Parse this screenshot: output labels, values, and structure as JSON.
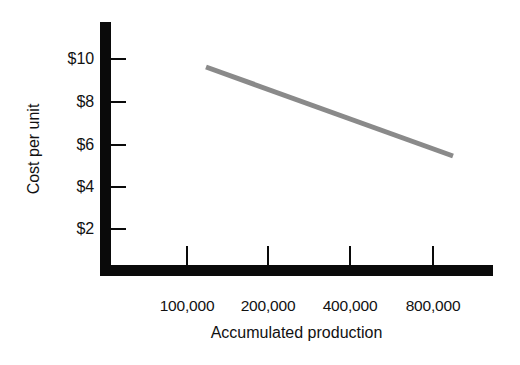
{
  "chart_data": {
    "type": "line",
    "title": "",
    "xlabel": "Accumulated production",
    "ylabel": "Cost per unit",
    "x_scale": "log2",
    "grid": false,
    "legend": "none",
    "x_tick_labels": [
      "100,000",
      "200,000",
      "400,000",
      "800,000"
    ],
    "x_tick_values": [
      100000,
      200000,
      400000,
      800000
    ],
    "y_tick_labels": [
      "$10",
      "$8",
      "$6",
      "$4",
      "$2"
    ],
    "y_tick_values": [
      10,
      8,
      6,
      4,
      2
    ],
    "ylim": [
      0,
      12
    ],
    "series": [
      {
        "name": "Cost per unit",
        "color": "#8a8a8a",
        "x": [
          130000,
          780000
        ],
        "y": [
          9.5,
          5.6
        ],
        "points": [
          {
            "x": 130000,
            "y": 9.5
          },
          {
            "x": 780000,
            "y": 5.6
          }
        ]
      }
    ],
    "annotations": []
  },
  "axes": {
    "y_title": "Cost per unit",
    "x_title": "Accumulated production",
    "color": "#0a0a0a"
  },
  "y_ticks": [
    {
      "label": "$10",
      "value": 10,
      "py": 59
    },
    {
      "label": "$8",
      "value": 8,
      "py": 102
    },
    {
      "label": "$6",
      "value": 6,
      "py": 145
    },
    {
      "label": "$4",
      "value": 4,
      "py": 187
    },
    {
      "label": "$2",
      "value": 2,
      "py": 229
    }
  ],
  "x_ticks": [
    {
      "label": "100,000",
      "value": 100000,
      "px": 187
    },
    {
      "label": "200,000",
      "value": 200000,
      "px": 268
    },
    {
      "label": "400,000",
      "value": 400000,
      "px": 350
    },
    {
      "label": "800,000",
      "value": 800000,
      "px": 433
    }
  ],
  "series_line": {
    "color": "#8a8a8a",
    "width": 5,
    "x1": 206,
    "y1": 67,
    "x2": 453,
    "y2": 156
  }
}
